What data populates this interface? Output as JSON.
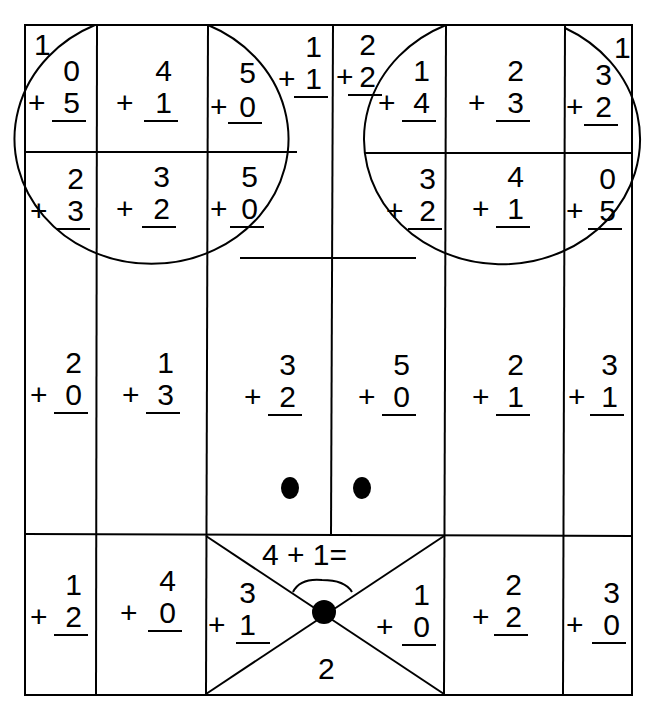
{
  "worksheet": {
    "type": "addition color-by-number worksheet (mouse face picture)",
    "problems": [
      {
        "id": "r1c1-corner",
        "top": "1",
        "plus": "",
        "bottom": ""
      },
      {
        "id": "r1c1",
        "top": "0",
        "bottom": "5"
      },
      {
        "id": "r1c2",
        "top": "4",
        "bottom": "1"
      },
      {
        "id": "r1c3",
        "top": "5",
        "bottom": "0"
      },
      {
        "id": "r1c3b",
        "top": "1",
        "bottom": "1"
      },
      {
        "id": "r1c4",
        "top": "2",
        "bottom": "2"
      },
      {
        "id": "r1c5",
        "top": "1",
        "bottom": "4"
      },
      {
        "id": "r1c6",
        "top": "2",
        "bottom": "3"
      },
      {
        "id": "r1c7",
        "top": "3",
        "bottom": "2"
      },
      {
        "id": "r1c7-corner",
        "top": "1"
      },
      {
        "id": "r2c1",
        "top": "2",
        "bottom": "3"
      },
      {
        "id": "r2c2",
        "top": "3",
        "bottom": "2"
      },
      {
        "id": "r2c3",
        "top": "5",
        "bottom": "0"
      },
      {
        "id": "r2c5",
        "top": "3",
        "bottom": "2"
      },
      {
        "id": "r2c6",
        "top": "4",
        "bottom": "1"
      },
      {
        "id": "r2c7",
        "top": "0",
        "bottom": "5"
      },
      {
        "id": "r3c1",
        "top": "2",
        "bottom": "0"
      },
      {
        "id": "r3c2",
        "top": "1",
        "bottom": "3"
      },
      {
        "id": "r3c3",
        "top": "3",
        "bottom": "2"
      },
      {
        "id": "r3c4",
        "top": "5",
        "bottom": "0"
      },
      {
        "id": "r3c5",
        "top": "2",
        "bottom": "1"
      },
      {
        "id": "r3c6",
        "top": "3",
        "bottom": "1"
      },
      {
        "id": "r4c1",
        "top": "1",
        "bottom": "2"
      },
      {
        "id": "r4c2",
        "top": "4",
        "bottom": "0"
      },
      {
        "id": "r4c3-left",
        "top": "3",
        "bottom": "1"
      },
      {
        "id": "r4c3-right",
        "top": "1",
        "bottom": "0"
      },
      {
        "id": "r4c5",
        "top": "2",
        "bottom": "2"
      },
      {
        "id": "r4c6",
        "top": "3",
        "bottom": "0"
      }
    ],
    "plus_sign": "+",
    "nose_equation": "4 + 1=",
    "mouth_number": "2"
  }
}
